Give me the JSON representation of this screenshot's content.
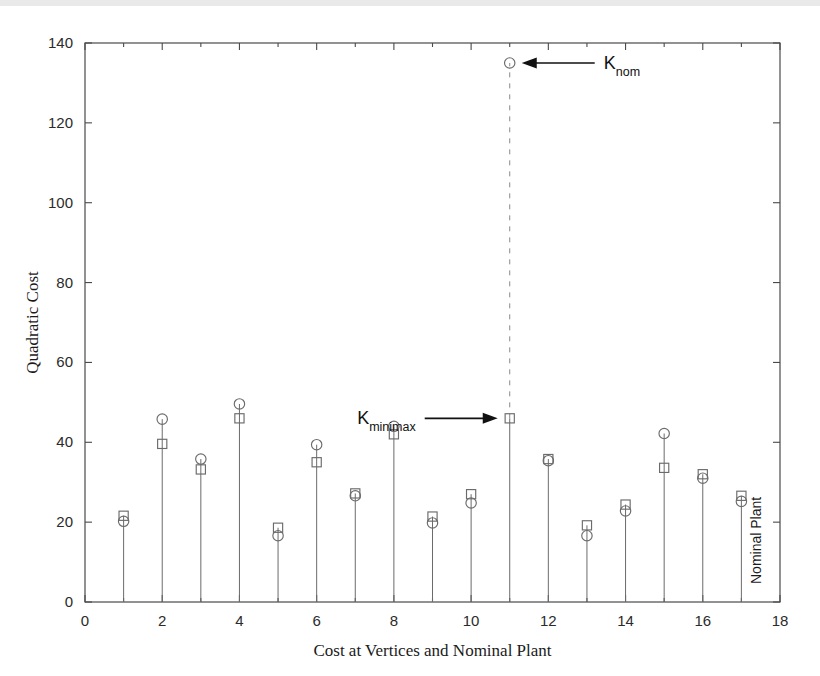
{
  "figure": {
    "background": "#ffffff",
    "marker_color": "#6b6b6b",
    "axis_color": "#4a4a4a",
    "annotation_color": "#111111"
  },
  "axes": {
    "x_label": "Cost at Vertices and Nominal Plant",
    "y_label": "Quadratic Cost",
    "x_ticks": [
      "0",
      "2",
      "4",
      "6",
      "8",
      "10",
      "12",
      "14",
      "16",
      "18"
    ],
    "y_ticks": [
      "0",
      "20",
      "40",
      "60",
      "80",
      "100",
      "120",
      "140"
    ]
  },
  "annotations": {
    "knom": {
      "base": "K",
      "sub": "nom"
    },
    "kminimax": {
      "base": "K",
      "sub": "minimax"
    },
    "nominal_plant": "Nominal Plant"
  },
  "chart_data": {
    "type": "scatter",
    "title": "",
    "xlabel": "Cost at Vertices and Nominal Plant",
    "ylabel": "Quadratic Cost",
    "xlim": [
      0,
      18
    ],
    "ylim": [
      0,
      140
    ],
    "xticks": [
      0,
      2,
      4,
      6,
      8,
      10,
      12,
      14,
      16,
      18
    ],
    "xticks_minor_step": 1,
    "yticks": [
      0,
      20,
      40,
      60,
      80,
      100,
      120,
      140
    ],
    "grid": false,
    "legend": "none",
    "x": [
      1,
      2,
      3,
      4,
      5,
      6,
      7,
      8,
      9,
      10,
      11,
      12,
      13,
      14,
      15,
      16,
      17
    ],
    "series": [
      {
        "name": "K_nom",
        "marker": "circle",
        "values": [
          20.2,
          45.8,
          35.8,
          49.6,
          16.6,
          39.4,
          26.6,
          44.0,
          19.8,
          24.8,
          135.0,
          35.4,
          16.6,
          22.8,
          42.2,
          31.0,
          25.2
        ]
      },
      {
        "name": "K_minimax",
        "marker": "square",
        "values": [
          21.6,
          39.6,
          33.2,
          46.0,
          18.6,
          35.0,
          27.2,
          42.0,
          21.4,
          27.0,
          46.0,
          35.8,
          19.2,
          24.4,
          33.6,
          32.0,
          26.6
        ]
      }
    ],
    "annotations": [
      {
        "text": "K_nom",
        "points_to_x": 11,
        "points_to_y": 135.0,
        "arrow_direction": "left"
      },
      {
        "text": "K_minimax",
        "points_to_x": 11,
        "points_to_y": 46.0,
        "arrow_direction": "right"
      },
      {
        "text": "Nominal Plant",
        "at_x": 17,
        "rotation": -90
      }
    ]
  }
}
